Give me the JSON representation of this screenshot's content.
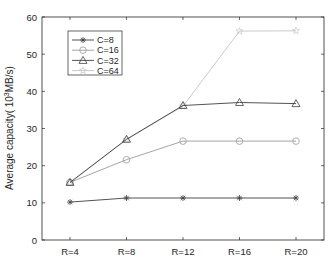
{
  "chart_data": {
    "type": "line",
    "title": "",
    "xlabel": "",
    "ylabel": "Average capacity( 10",
    "ylabel_sup": "3",
    "ylabel_tail": "MB/s)",
    "categories": [
      "R=4",
      "R=8",
      "R=12",
      "R=16",
      "R=20"
    ],
    "ylim": [
      0,
      60
    ],
    "yticks": [
      0,
      10,
      20,
      30,
      40,
      50,
      60
    ],
    "grid": false,
    "legend_position": "upper left",
    "series": [
      {
        "name": "C=8",
        "marker": "asterisk",
        "color": "#404040",
        "values": [
          10.2,
          11.3,
          11.3,
          11.3,
          11.3
        ]
      },
      {
        "name": "C=16",
        "marker": "circle",
        "color": "#9a9a9a",
        "values": [
          15.5,
          21.6,
          26.6,
          26.6,
          26.6
        ]
      },
      {
        "name": "C=32",
        "marker": "triangle",
        "color": "#404040",
        "values": [
          15.5,
          27.1,
          36.2,
          37.0,
          36.7
        ]
      },
      {
        "name": "C=64",
        "marker": "star",
        "color": "#c4c4c4",
        "values": [
          15.4,
          27.0,
          36.0,
          56.2,
          56.3
        ]
      }
    ]
  }
}
